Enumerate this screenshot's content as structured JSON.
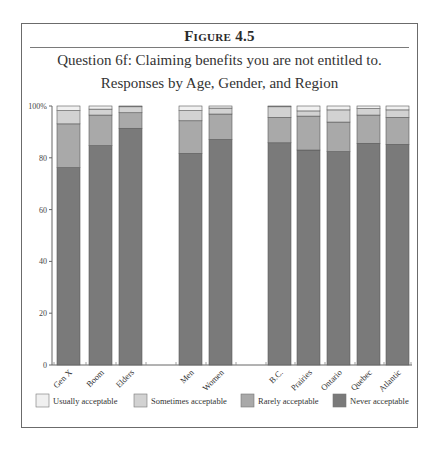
{
  "figure_label": "Figure 4.5",
  "chart_data": {
    "type": "bar",
    "stacked": true,
    "title": "Question 6f: Claiming benefits you are not entitled to.",
    "subtitle": "Responses by Age, Gender, and Region",
    "xlabel": "",
    "ylabel": "",
    "ylim": [
      0,
      100
    ],
    "yticks": [
      0,
      20,
      40,
      60,
      80,
      100
    ],
    "ytick_labels": [
      "0",
      "20",
      "40",
      "60",
      "80",
      "100%"
    ],
    "grid": false,
    "groups": [
      {
        "name": "Age",
        "categories": [
          "Gen X",
          "Boom",
          "Elders"
        ]
      },
      {
        "name": "Gender",
        "categories": [
          "Men",
          "Women"
        ]
      },
      {
        "name": "Region",
        "categories": [
          "B.C.",
          "Prairies",
          "Ontario",
          "Quebec",
          "Atlantic"
        ]
      }
    ],
    "categories": [
      "Gen X",
      "Boom",
      "Elders",
      "Men",
      "Women",
      "B.C.",
      "Prairies",
      "Ontario",
      "Quebec",
      "Atlantic"
    ],
    "series": [
      {
        "name": "Never acceptable",
        "color": "#7a7a7a",
        "values": [
          76.2,
          84.7,
          91.4,
          81.7,
          87.1,
          85.8,
          83.0,
          82.4,
          85.6,
          85.2
        ]
      },
      {
        "name": "Rarely acceptable",
        "color": "#a9a9a9",
        "values": [
          16.9,
          11.8,
          6.0,
          12.6,
          9.8,
          9.8,
          13.1,
          11.4,
          10.9,
          10.4
        ]
      },
      {
        "name": "Sometimes acceptable",
        "color": "#d2d2d2",
        "values": [
          5.1,
          2.3,
          2.3,
          3.9,
          2.3,
          4.1,
          2.0,
          4.7,
          2.5,
          2.9
        ]
      },
      {
        "name": "Usually acceptable",
        "color": "#f0f0f0",
        "values": [
          1.8,
          1.2,
          0.3,
          1.8,
          0.8,
          0.3,
          1.9,
          1.5,
          1.0,
          1.5
        ]
      }
    ],
    "legend": {
      "placement": "bottom",
      "order": [
        "Usually acceptable",
        "Sometimes acceptable",
        "Rarely acceptable",
        "Never acceptable"
      ]
    }
  }
}
